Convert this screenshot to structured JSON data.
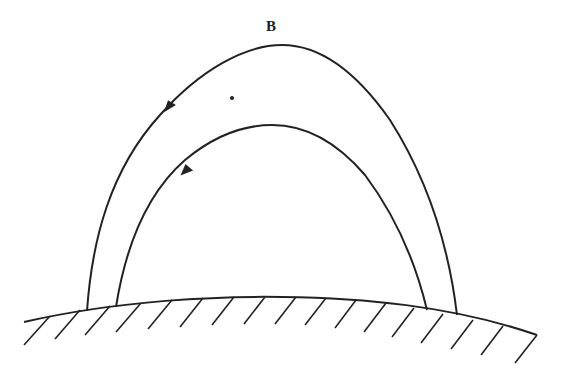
{
  "figure": {
    "labels": {
      "top": "B"
    },
    "colors": {
      "line": "#222222",
      "background": "#ffffff"
    },
    "elements": {
      "outer_field_line": "outer arch curve with upward arrow on left side",
      "inner_field_line": "inner arch curve with upward arrow on left side",
      "ground": "curved surface with diagonal hatching",
      "mark": "small dot inside outer arch, upper left"
    }
  }
}
